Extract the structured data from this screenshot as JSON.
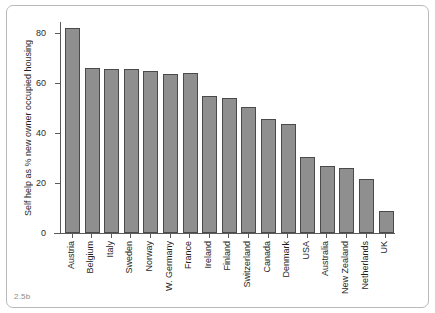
{
  "figure": {
    "number": "2.5b"
  },
  "chart_data": {
    "type": "bar",
    "title": "",
    "xlabel": "",
    "ylabel": "Self help as % new owner occupied housing",
    "ylim": [
      0,
      86
    ],
    "yticks": [
      0,
      20,
      40,
      60,
      80
    ],
    "ytick_labels": [
      "0",
      "20",
      "40",
      "60",
      "80"
    ],
    "grid": false,
    "legend": false,
    "categories": [
      "Austria",
      "Belgium",
      "Italy",
      "Sweden",
      "Norway",
      "W. Germany",
      "France",
      "Ireland",
      "Finland",
      "Switzerland",
      "Canada",
      "Denmark",
      "USA",
      "Australia",
      "New Zealand",
      "Netherlands",
      "UK"
    ],
    "values": [
      82,
      66,
      65.5,
      65.5,
      65,
      63.5,
      64,
      55,
      54,
      50.5,
      45.5,
      43.5,
      30.5,
      27,
      26,
      21.5,
      9
    ],
    "bar_color": "#8f8f8f",
    "bar_edge_color": "#4a4a4a",
    "axis_color": "#5a5a5a"
  }
}
